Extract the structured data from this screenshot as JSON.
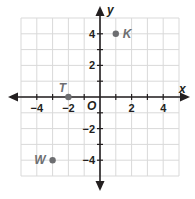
{
  "chart_data": {
    "type": "scatter",
    "title": "",
    "xlabel": "x",
    "ylabel": "y",
    "xlim": [
      -5,
      5
    ],
    "ylim": [
      -5,
      5
    ],
    "grid": true,
    "origin_label": "O",
    "x_ticks": [
      -4,
      -2,
      2,
      4
    ],
    "y_ticks": [
      4,
      2,
      -2,
      -4
    ],
    "x_tick_labels": [
      "−4",
      "−2",
      "2",
      "4"
    ],
    "y_tick_labels": [
      "4",
      "2",
      "−2",
      "−4"
    ],
    "points": [
      {
        "label": "K",
        "x": 1,
        "y": 4
      },
      {
        "label": "T",
        "x": -2,
        "y": 0
      },
      {
        "label": "W",
        "x": -3,
        "y": -4
      }
    ]
  },
  "colors": {
    "grid": "#d9d9d9",
    "axis": "#231f20",
    "point": "#6d6e71"
  }
}
